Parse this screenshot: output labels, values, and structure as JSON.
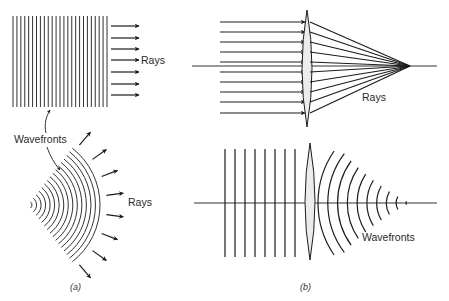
{
  "figure": {
    "panel_a": {
      "caption": "(a)",
      "plane_wave": {
        "wavefront_count": 25,
        "x_start": 13,
        "x_end": 107,
        "y_top": 16,
        "y_bottom": 107,
        "ray_count": 7,
        "ray_ys": [
          26,
          38,
          49,
          60,
          72,
          84,
          95
        ],
        "ray_x_start": 111,
        "ray_x_end": 139,
        "rays_label": "Rays"
      },
      "wavefronts_label": "Wavefronts",
      "spherical_wave": {
        "center": [
          28,
          205
        ],
        "arc_count": 16,
        "r_min": 4,
        "r_max": 72,
        "half_angle_deg": 52,
        "ray_count": 8,
        "rays_label": "Rays"
      }
    },
    "panel_b": {
      "caption": "(b)",
      "top": {
        "axis_y": 66,
        "axis_x_start": 192,
        "axis_x_end": 437,
        "lens_x": 307,
        "lens_y_top": 10,
        "lens_y_bottom": 127,
        "lens_half_width": 5,
        "ray_ys": [
          22,
          32,
          42,
          52,
          62,
          72,
          82,
          92,
          102,
          113
        ],
        "ray_x_start": 220,
        "focus": [
          410,
          66
        ],
        "rays_label": "Rays"
      },
      "bottom": {
        "axis_y": 203,
        "axis_x_start": 194,
        "axis_x_end": 437,
        "lens_x": 310,
        "lens_y_top": 143,
        "lens_y_bottom": 260,
        "lens_half_width": 5,
        "plane_wavefront_xs": [
          225,
          235,
          245,
          255,
          265,
          275,
          285,
          295
        ],
        "plane_y_top": 149,
        "plane_y_bottom": 257,
        "converging_arc_count": 10,
        "focus": [
          410,
          203
        ],
        "wavefronts_label": "Wavefronts"
      }
    }
  }
}
